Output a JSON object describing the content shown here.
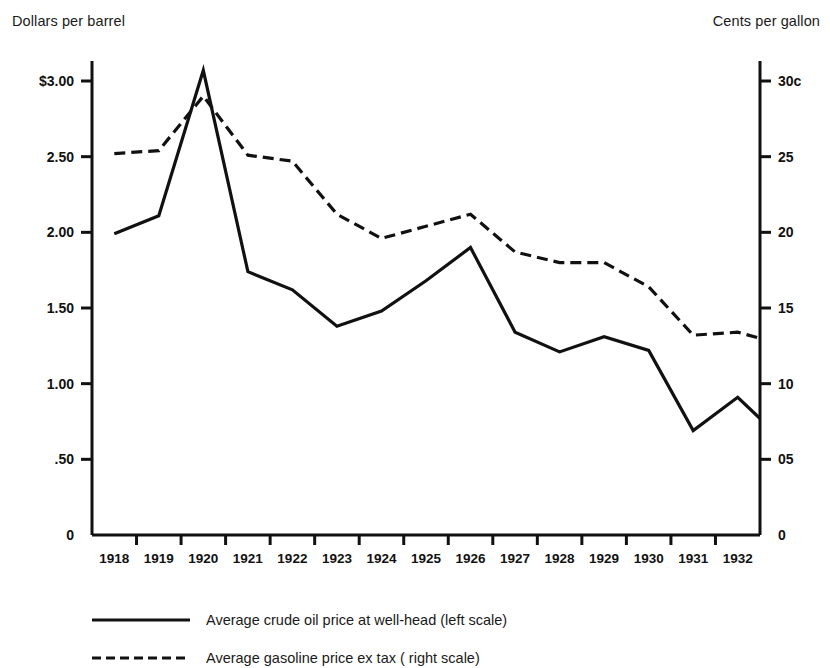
{
  "axis_titles": {
    "left": "Dollars per barrel",
    "right": "Cents per gallon"
  },
  "left_ticks": [
    {
      "label": "$3.00",
      "value": 3.0
    },
    {
      "label": "2.50",
      "value": 2.5
    },
    {
      "label": "2.00",
      "value": 2.0
    },
    {
      "label": "1.50",
      "value": 1.5
    },
    {
      "label": "1.00",
      "value": 1.0
    },
    {
      "label": ".50",
      "value": 0.5
    },
    {
      "label": "0",
      "value": 0.0
    }
  ],
  "right_ticks": [
    {
      "label": "30c",
      "value": 30
    },
    {
      "label": "25",
      "value": 25
    },
    {
      "label": "20",
      "value": 20
    },
    {
      "label": "15",
      "value": 15
    },
    {
      "label": "10",
      "value": 10
    },
    {
      "label": "05",
      "value": 5
    },
    {
      "label": "0",
      "value": 0
    }
  ],
  "legend": [
    {
      "key": "solid-line-key",
      "label": "Average crude oil price at well-head (left scale)"
    },
    {
      "key": "dashed-line-key",
      "label": "Average gasoline price ex tax ( right scale)"
    }
  ],
  "colors": {
    "line": "#111111",
    "axis": "#111111",
    "background": "#ffffff"
  },
  "chart_data": {
    "type": "line",
    "title": "",
    "xlabel": "",
    "ylabel": "Dollars per barrel",
    "y2label": "Cents per gallon",
    "grid": false,
    "legend_position": "below",
    "categories": [
      "1918",
      "1919",
      "1920",
      "1921",
      "1922",
      "1923",
      "1924",
      "1925",
      "1926",
      "1927",
      "1928",
      "1929",
      "1930",
      "1931",
      "1932"
    ],
    "xlim": [
      "1918",
      "1932"
    ],
    "ylim": [
      0,
      3.0
    ],
    "y2lim": [
      0,
      30
    ],
    "series": [
      {
        "name": "Average crude oil price at well-head (left scale)",
        "axis": "left",
        "style": "solid",
        "units": "dollars per barrel",
        "values": [
          1.99,
          2.11,
          3.07,
          1.74,
          1.62,
          1.38,
          1.48,
          1.68,
          1.9,
          1.34,
          1.21,
          1.31,
          1.22,
          0.69,
          0.91
        ],
        "end_value": 0.77
      },
      {
        "name": "Average gasoline price ex tax ( right scale)",
        "axis": "right",
        "style": "dashed",
        "units": "cents per gallon",
        "values": [
          25.2,
          25.4,
          29.0,
          25.1,
          24.7,
          21.2,
          19.6,
          20.4,
          21.2,
          18.7,
          18.0,
          18.0,
          16.4,
          13.2,
          13.4
        ],
        "end_value": 13.0
      }
    ]
  }
}
